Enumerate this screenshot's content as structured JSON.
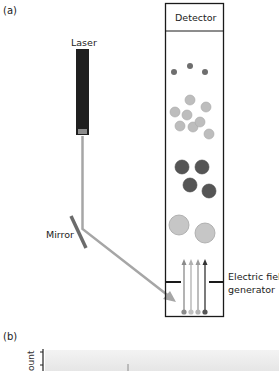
{
  "panel_a": {
    "label": "(a)",
    "laser_label": "Laser",
    "mirror_label": "Mirror",
    "detector_label": "Detector",
    "field_label_line1": "Electric field",
    "field_label_line2": "generator"
  },
  "panel_b": {
    "label": "(b)",
    "y_axis_label_partial": "ount"
  },
  "colors": {
    "laser_body": "#1f1f1f",
    "laser_window": "#8c8c8c",
    "beam": "#a6a6a6",
    "mirror": "#6b6b6b",
    "particle_small": "#6e6e6e",
    "particle_medium": "#bdbdbd",
    "particle_dark": "#555555",
    "particle_large": "#c6c6c6",
    "box_stroke": "#1a1a1a"
  },
  "particles": {
    "small": [
      [
        174,
        72
      ],
      [
        190,
        66
      ],
      [
        205,
        72
      ]
    ],
    "medium": [
      [
        190,
        100
      ],
      [
        175,
        112
      ],
      [
        187,
        115
      ],
      [
        206,
        107
      ],
      [
        180,
        126
      ],
      [
        193,
        127
      ],
      [
        200,
        122
      ],
      [
        209,
        134
      ]
    ],
    "dark": [
      [
        182,
        167
      ],
      [
        202,
        167
      ],
      [
        190,
        185
      ],
      [
        209,
        191
      ]
    ],
    "large": [
      [
        179,
        225
      ],
      [
        205,
        233
      ]
    ]
  }
}
